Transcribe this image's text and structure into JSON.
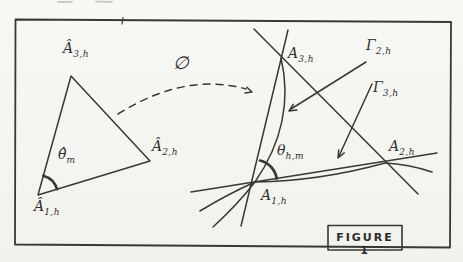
{
  "figure": {
    "caption": "FIGURE 1",
    "map_label": "∅",
    "left_triangle": {
      "vertex_a3": {
        "main": "Â",
        "sub": "3,h"
      },
      "vertex_a2": {
        "main": "Â",
        "sub": "2,h"
      },
      "vertex_a1": {
        "main": "Â",
        "sub": "1,h"
      },
      "angle": {
        "main": "θ̂",
        "sub": "m"
      }
    },
    "right_triangle": {
      "vertex_a3": {
        "main": "A",
        "sub": "3,h"
      },
      "vertex_a2": {
        "main": "A",
        "sub": "2,h"
      },
      "vertex_a1": {
        "main": "A",
        "sub": "1,h"
      },
      "edge_gamma2": {
        "main": "Γ",
        "sub": "2,h"
      },
      "edge_gamma3": {
        "main": "Γ",
        "sub": "3,h"
      },
      "angle": {
        "main": "θ",
        "sub": "h,m"
      }
    },
    "ink_color": "#383838"
  }
}
